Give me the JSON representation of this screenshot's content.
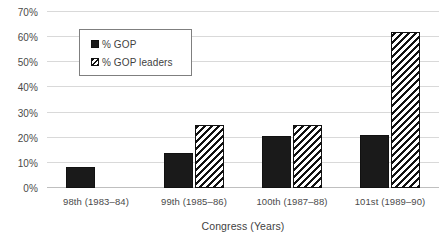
{
  "chart_data": {
    "type": "bar",
    "title": "",
    "xlabel": "Congress (Years)",
    "ylabel": "",
    "categories": [
      "98th (1983–84)",
      "99th (1985–86)",
      "100th (1987–88)",
      "101st (1989–90)"
    ],
    "series": [
      {
        "name": "% GOP",
        "values": [
          8.5,
          14,
          20.5,
          21
        ],
        "fill": "solid",
        "color": "#1a1a1a"
      },
      {
        "name": "% GOP leaders",
        "values": [
          0,
          25,
          25,
          62
        ],
        "fill": "hatched",
        "color": "#111111"
      }
    ],
    "ylim": [
      0,
      70
    ],
    "yticks": [
      0,
      10,
      20,
      30,
      40,
      50,
      60,
      70
    ],
    "ytick_labels": [
      "0%",
      "10%",
      "20%",
      "30%",
      "40%",
      "50%",
      "60%",
      "70%"
    ],
    "grid": true,
    "grid_axis": "y",
    "legend_position": "upper-left-inside",
    "legend_entries": [
      "% GOP",
      "% GOP leaders"
    ],
    "background": "#ffffff",
    "gridline_color": "#d9d9d9"
  }
}
